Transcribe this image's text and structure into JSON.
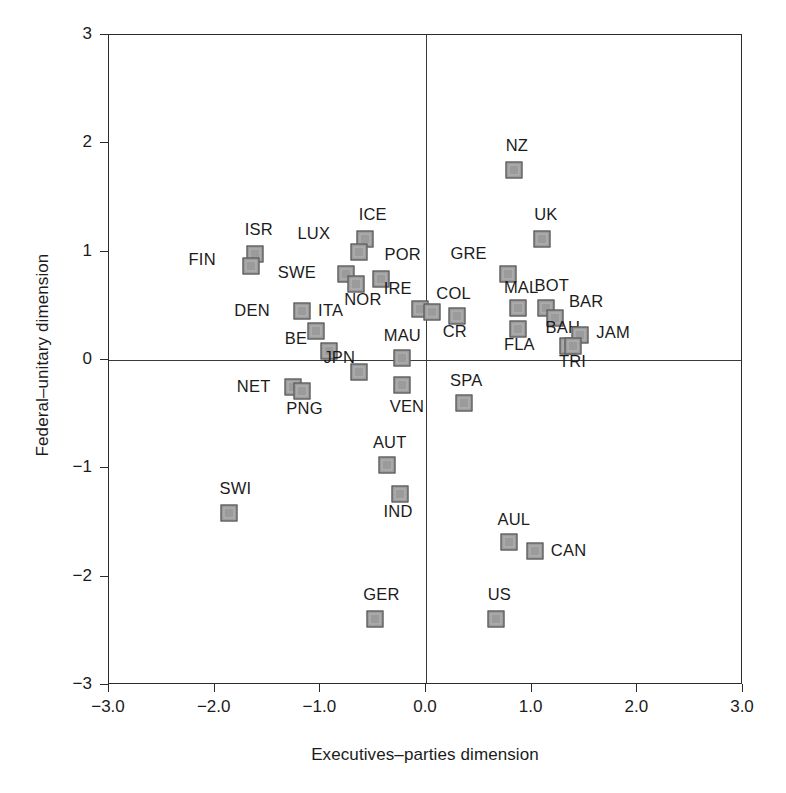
{
  "chart_data": {
    "type": "scatter",
    "title": "",
    "xlabel": "Executives–parties dimension",
    "ylabel": "Federal–unitary dimension",
    "xlim": [
      -3.0,
      3.0
    ],
    "ylim": [
      -3.0,
      3.0
    ],
    "grid": false,
    "legend": "none",
    "xticks": [
      "-3.0",
      "-2.0",
      "-1.0",
      "0.0",
      "1.0",
      "2.0",
      "3.0"
    ],
    "xtick_values": [
      -3.0,
      -2.0,
      -1.0,
      0.0,
      1.0,
      2.0,
      3.0
    ],
    "yticks": [
      "3",
      "2",
      "1",
      "0",
      "-1",
      "-2",
      "-3"
    ],
    "ytick_values": [
      3,
      2,
      1,
      0,
      -1,
      -2,
      -3
    ],
    "zero_lines": {
      "x": 0.0,
      "y": 0.0
    },
    "marker_color": "#9b9b9b",
    "marker_edge_color": "#4a4a4a",
    "points": [
      {
        "label": "NZ",
        "x": 0.83,
        "y": 1.75,
        "lx": -8,
        "ly": -26
      },
      {
        "label": "UK",
        "x": 1.1,
        "y": 1.12,
        "lx": -8,
        "ly": -26
      },
      {
        "label": "ICE",
        "x": -0.58,
        "y": 1.12,
        "lx": -6,
        "ly": -26
      },
      {
        "label": "ISR",
        "x": -1.62,
        "y": 0.98,
        "lx": -10,
        "ly": -26
      },
      {
        "label": "FIN",
        "x": -1.66,
        "y": 0.87,
        "lx": -62,
        "ly": -8
      },
      {
        "label": "LUX",
        "x": -0.63,
        "y": 1.0,
        "lx": -62,
        "ly": -20
      },
      {
        "label": "POR",
        "x": -0.43,
        "y": 0.75,
        "lx": 4,
        "ly": -26
      },
      {
        "label": "SWE",
        "x": -0.76,
        "y": 0.79,
        "lx": -68,
        "ly": -3
      },
      {
        "label": "GRE",
        "x": 0.78,
        "y": 0.79,
        "lx": -58,
        "ly": -22
      },
      {
        "label": "NOR",
        "x": -0.66,
        "y": 0.7,
        "lx": -12,
        "ly": 14
      },
      {
        "label": "DEN",
        "x": -1.17,
        "y": 0.45,
        "lx": -68,
        "ly": -2
      },
      {
        "label": "ITA",
        "x": -1.04,
        "y": 0.27,
        "lx": 2,
        "ly": -22
      },
      {
        "label": "MAL",
        "x": 0.87,
        "y": 0.48,
        "lx": -14,
        "ly": -22
      },
      {
        "label": "BOT",
        "x": 1.14,
        "y": 0.48,
        "lx": -12,
        "ly": -24
      },
      {
        "label": "BAR",
        "x": 1.22,
        "y": 0.39,
        "lx": 14,
        "ly": -18
      },
      {
        "label": "IRE",
        "x": -0.06,
        "y": 0.47,
        "lx": -36,
        "ly": -22
      },
      {
        "label": "COL",
        "x": 0.06,
        "y": 0.44,
        "lx": 4,
        "ly": -20
      },
      {
        "label": "CR",
        "x": 0.29,
        "y": 0.41,
        "lx": -14,
        "ly": 14
      },
      {
        "label": "BE",
        "x": -0.92,
        "y": 0.08,
        "lx": -44,
        "ly": -14
      },
      {
        "label": "FLA",
        "x": 0.87,
        "y": 0.29,
        "lx": -14,
        "ly": 14
      },
      {
        "label": "BAH",
        "x": 1.34,
        "y": 0.13,
        "lx": -22,
        "ly": -20
      },
      {
        "label": "JAM",
        "x": 1.46,
        "y": 0.23,
        "lx": 16,
        "ly": -4
      },
      {
        "label": "TRI",
        "x": 1.39,
        "y": 0.13,
        "lx": -14,
        "ly": 14
      },
      {
        "label": "MAU",
        "x": -0.23,
        "y": 0.02,
        "lx": -18,
        "ly": -24
      },
      {
        "label": "JPN",
        "x": -0.63,
        "y": -0.11,
        "lx": -36,
        "ly": -16
      },
      {
        "label": "NET",
        "x": -1.26,
        "y": -0.25,
        "lx": -56,
        "ly": -2
      },
      {
        "label": "PNG",
        "x": -1.17,
        "y": -0.29,
        "lx": -16,
        "ly": 16
      },
      {
        "label": "VEN",
        "x": -0.23,
        "y": -0.23,
        "lx": -12,
        "ly": 20
      },
      {
        "label": "SPA",
        "x": 0.36,
        "y": -0.4,
        "lx": -14,
        "ly": -24
      },
      {
        "label": "AUT",
        "x": -0.37,
        "y": -0.97,
        "lx": -14,
        "ly": -24
      },
      {
        "label": "IND",
        "x": -0.25,
        "y": -1.24,
        "lx": -16,
        "ly": 16
      },
      {
        "label": "SWI",
        "x": -1.86,
        "y": -1.41,
        "lx": -10,
        "ly": -26
      },
      {
        "label": "AUL",
        "x": 0.79,
        "y": -1.68,
        "lx": -12,
        "ly": -24
      },
      {
        "label": "CAN",
        "x": 1.03,
        "y": -1.76,
        "lx": 16,
        "ly": -2
      },
      {
        "label": "GER",
        "x": -0.48,
        "y": -2.39,
        "lx": -12,
        "ly": -26
      },
      {
        "label": "US",
        "x": 0.66,
        "y": -2.39,
        "lx": -8,
        "ly": -26
      }
    ]
  }
}
